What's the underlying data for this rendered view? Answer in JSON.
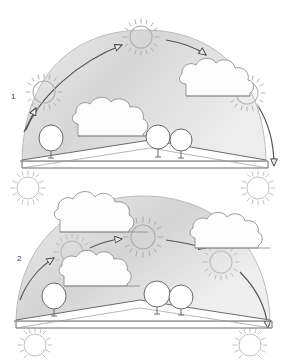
{
  "figure": {
    "background_color": "#ffffff",
    "ink_color": "#7a7a7a",
    "dark_ink_color": "#55555a",
    "dome_fill_color": "#d9d9d9",
    "cloud_fill_color": "#fdfdfd",
    "sun_color": "#b9b9b9",
    "width": 288,
    "height": 360
  },
  "scenes": [
    {
      "id": "scene-1",
      "label": "1",
      "label_x": 11,
      "label_y": 96,
      "description": "high sun path",
      "dome": {
        "left_x": 22,
        "right_x": 266,
        "base_y": 160,
        "apex_y": 30,
        "fill": "#d9d9d9"
      },
      "ground": {
        "horizon_y": 160,
        "hill_peak_x": 150,
        "hill_peak_y": 140,
        "baseline_y": 168
      },
      "suns": [
        {
          "name": "sun-rising",
          "cx": 44,
          "cy": 92,
          "r": 12,
          "rays": 18
        },
        {
          "name": "sun-noon",
          "cx": 141,
          "cy": 37,
          "r": 12,
          "rays": 18
        },
        {
          "name": "sun-setting",
          "cx": 247,
          "cy": 93,
          "r": 12,
          "rays": 18
        },
        {
          "name": "sun-night-left",
          "cx": 28,
          "cy": 188,
          "r": 12,
          "rays": 18
        },
        {
          "name": "sun-night-right",
          "cx": 258,
          "cy": 188,
          "r": 12,
          "rays": 18
        }
      ],
      "arrows": [
        {
          "name": "arrow-sunrise-to-noon",
          "from_x": 28,
          "from_y": 128,
          "to_x": 124,
          "to_y": 44
        },
        {
          "name": "arrow-noon-to-sunset",
          "from_x": 168,
          "from_y": 40,
          "to_x": 208,
          "to_y": 56
        },
        {
          "name": "arrow-sunset-descent",
          "from_x": 262,
          "from_y": 110,
          "to_x": 272,
          "to_y": 168
        }
      ],
      "clouds": [
        {
          "name": "cloud-right",
          "x": 186,
          "y": 60,
          "w": 82,
          "h": 38
        },
        {
          "name": "cloud-mid",
          "x": 78,
          "y": 100,
          "w": 84,
          "h": 38
        }
      ],
      "trees": [
        {
          "name": "tree-left",
          "cx": 51,
          "cy": 138,
          "r": 12,
          "base_y": 158
        },
        {
          "name": "tree-mid",
          "cx": 158,
          "cy": 138,
          "r": 12,
          "base_y": 157
        },
        {
          "name": "tree-right",
          "cx": 181,
          "cy": 140,
          "r": 11,
          "base_y": 158
        }
      ]
    },
    {
      "id": "scene-2",
      "label": "2",
      "label_x": 17,
      "label_y": 258,
      "description": "low sun path",
      "dome": {
        "left_x": 16,
        "right_x": 270,
        "base_y": 320,
        "apex_y": 196,
        "fill": "#d9d9d9"
      },
      "ground": {
        "horizon_y": 320,
        "hill_peak_x": 140,
        "hill_peak_y": 300,
        "baseline_y": 328
      },
      "suns": [
        {
          "name": "sun-rising",
          "cx": 72,
          "cy": 252,
          "r": 12,
          "rays": 18
        },
        {
          "name": "sun-noon",
          "cx": 143,
          "cy": 237,
          "r": 13,
          "rays": 18
        },
        {
          "name": "sun-setting",
          "cx": 221,
          "cy": 262,
          "r": 12,
          "rays": 18
        },
        {
          "name": "sun-night-left",
          "cx": 27,
          "cy": 182,
          "r": 12,
          "rays": 18
        },
        {
          "name": "sun-night-right",
          "cx": 258,
          "cy": 182,
          "r": 12,
          "rays": 18
        },
        {
          "name": "sun-dawn-left",
          "cx": 35,
          "cy": 345,
          "r": 12,
          "rays": 18
        },
        {
          "name": "sun-dusk-right",
          "cx": 250,
          "cy": 345,
          "r": 12,
          "rays": 18
        }
      ],
      "arrows": [
        {
          "name": "arrow-sunrise-to-noon",
          "from_x": 24,
          "from_y": 292,
          "to_x": 56,
          "to_y": 255
        },
        {
          "name": "arrow-mid-ascent",
          "from_x": 92,
          "from_y": 246,
          "to_x": 124,
          "to_y": 238
        },
        {
          "name": "arrow-noon-to-sunset",
          "from_x": 166,
          "from_y": 238,
          "to_x": 209,
          "to_y": 247
        },
        {
          "name": "arrow-sunset-descent",
          "from_x": 244,
          "from_y": 268,
          "to_x": 268,
          "to_y": 330
        }
      ],
      "clouds": [
        {
          "name": "cloud-top",
          "x": 60,
          "y": 190,
          "w": 88,
          "h": 42
        },
        {
          "name": "cloud-right",
          "x": 190,
          "y": 212,
          "w": 80,
          "h": 36
        },
        {
          "name": "cloud-mid",
          "x": 62,
          "y": 250,
          "w": 76,
          "h": 36
        }
      ],
      "trees": [
        {
          "name": "tree-left",
          "cx": 54,
          "cy": 296,
          "r": 12,
          "base_y": 316
        },
        {
          "name": "tree-mid",
          "cx": 157,
          "cy": 294,
          "r": 13,
          "base_y": 314
        },
        {
          "name": "tree-right",
          "cx": 181,
          "cy": 297,
          "r": 12,
          "base_y": 315
        }
      ]
    }
  ]
}
